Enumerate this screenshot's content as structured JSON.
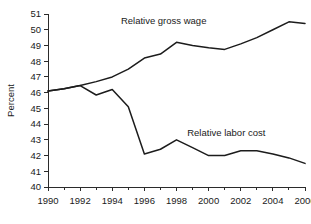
{
  "chart_data": {
    "type": "line",
    "title": "",
    "subtitle": "",
    "xlabel": "",
    "ylabel": "Percent",
    "xlim": [
      1990,
      2006
    ],
    "ylim": [
      40,
      51
    ],
    "grid": false,
    "legend_position": "inline-annotation",
    "x": [
      1990,
      1991,
      1992,
      1993,
      1994,
      1995,
      1996,
      1997,
      1998,
      1999,
      2000,
      2001,
      2002,
      2003,
      2004,
      2005,
      2006
    ],
    "x_tick_labels": [
      "1990",
      "1992",
      "1994",
      "1996",
      "1998",
      "2000",
      "2002",
      "2004",
      "2006"
    ],
    "x_tick_values": [
      1990,
      1992,
      1994,
      1996,
      1998,
      2000,
      2002,
      2004,
      2006
    ],
    "x_minor_tick_values": [
      1991,
      1993,
      1995,
      1997,
      1999,
      2001,
      2003,
      2005
    ],
    "y_tick_labels": [
      "40",
      "41",
      "42",
      "43",
      "44",
      "45",
      "46",
      "47",
      "48",
      "49",
      "50",
      "51"
    ],
    "y_tick_values": [
      40,
      41,
      42,
      43,
      44,
      45,
      46,
      47,
      48,
      49,
      50,
      51
    ],
    "series": [
      {
        "name": "Relative gross wage",
        "color": "#1c1c1c",
        "label_x": 1997.2,
        "label_y": 50.55,
        "values": [
          46.1,
          46.25,
          46.45,
          46.7,
          47.0,
          47.5,
          48.2,
          48.45,
          49.2,
          49.0,
          48.85,
          48.75,
          49.1,
          49.5,
          50.0,
          50.5,
          50.4
        ]
      },
      {
        "name": "Relative labor cost",
        "color": "#1c1c1c",
        "label_x": 2001.1,
        "label_y": 43.45,
        "values": [
          46.1,
          46.25,
          46.45,
          45.85,
          46.2,
          45.1,
          42.1,
          42.4,
          43.0,
          42.5,
          42.0,
          42.0,
          42.3,
          42.3,
          42.1,
          41.85,
          41.5
        ]
      }
    ]
  }
}
